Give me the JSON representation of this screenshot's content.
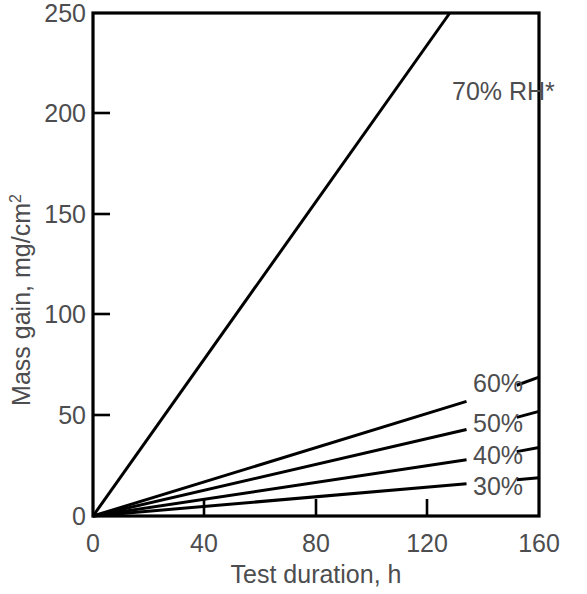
{
  "chart_data": {
    "type": "line",
    "title": "",
    "xlabel": "Test duration, h",
    "ylabel": "Mass gain, mg/cm²",
    "ylabel_base": "Mass gain, mg/cm",
    "ylabel_sup": "2",
    "xlim": [
      0,
      160
    ],
    "ylim": [
      0,
      250
    ],
    "xticks": [
      0,
      40,
      80,
      120,
      160
    ],
    "xtick_labels": [
      "0",
      "40",
      "80",
      "120",
      "160"
    ],
    "yticks": [
      0,
      50,
      100,
      150,
      200,
      250
    ],
    "ytick_labels": [
      "0",
      "50",
      "100",
      "150",
      "200",
      "250"
    ],
    "grid": false,
    "legend_position": "inline-right",
    "series": [
      {
        "name": "70% RH*",
        "label": "70% RH*",
        "label_x": 129,
        "label_y": 213,
        "slope_mg_per_h": 1.955,
        "x": [
          0,
          128
        ],
        "values": [
          0,
          250
        ],
        "clipped_at_top": true
      },
      {
        "name": "60%",
        "label": "60%",
        "label_x": 141,
        "label_y": 64,
        "slope_mg_per_h": 0.427,
        "x": [
          0,
          134
        ],
        "values": [
          0,
          57
        ],
        "tail_x": [
          152,
          160
        ],
        "tail_values": [
          65,
          69
        ]
      },
      {
        "name": "50%",
        "label": "50%",
        "label_x": 141,
        "label_y": 45,
        "slope_mg_per_h": 0.321,
        "x": [
          0,
          134
        ],
        "values": [
          0,
          43
        ],
        "tail_x": [
          152,
          160
        ],
        "tail_values": [
          49,
          52
        ]
      },
      {
        "name": "40%",
        "label": "40%",
        "label_x": 141,
        "label_y": 30,
        "slope_mg_per_h": 0.209,
        "x": [
          0,
          134
        ],
        "values": [
          0,
          28
        ],
        "tail_x": [
          152,
          160
        ],
        "tail_values": [
          32,
          34
        ]
      },
      {
        "name": "30%",
        "label": "30%",
        "label_x": 141,
        "label_y": 16,
        "slope_mg_per_h": 0.119,
        "x": [
          0,
          134
        ],
        "values": [
          0,
          16
        ],
        "tail_x": [
          152,
          160
        ],
        "tail_values": [
          18,
          19
        ]
      }
    ],
    "footnote_marker": "*",
    "colors": {
      "line": "#000000",
      "text": "#4d4d4f",
      "axis": "#000000",
      "background": "#ffffff"
    }
  }
}
